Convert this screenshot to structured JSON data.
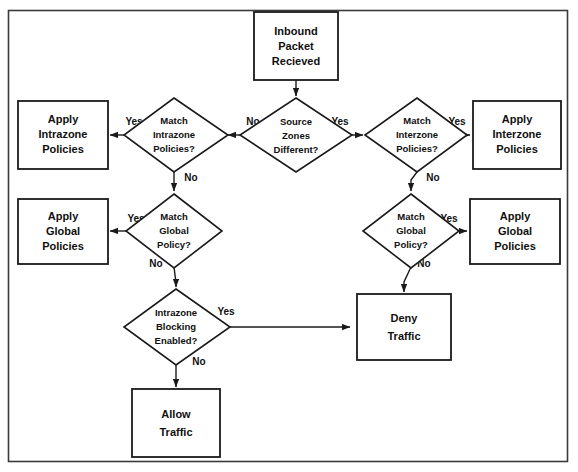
{
  "diagram": {
    "type": "flowchart",
    "colors": {
      "background": "#ffffff",
      "stroke": "#1a1a1a",
      "text": "#101010",
      "frame": "#3a3a3a"
    },
    "frame": {
      "x": 8,
      "y": 10,
      "width": 560,
      "height": 452
    },
    "nodes": [
      {
        "id": "inbound-packet",
        "shape": "process",
        "lines": [
          "Inbound",
          "Packet",
          "Recieved"
        ],
        "cx": 296,
        "cy": 46,
        "w": 84,
        "h": 68
      },
      {
        "id": "source-zones-different",
        "shape": "decision",
        "lines": [
          "Source",
          "Zones",
          "Different?"
        ],
        "cx": 296,
        "cy": 135,
        "w": 112,
        "h": 74
      },
      {
        "id": "match-intrazone-policies",
        "shape": "decision",
        "lines": [
          "Match",
          "Intrazone",
          "Policies?"
        ],
        "cx": 174,
        "cy": 135,
        "w": 100,
        "h": 74
      },
      {
        "id": "match-interzone-policies",
        "shape": "decision",
        "lines": [
          "Match",
          "Interzone",
          "Policies?"
        ],
        "cx": 417,
        "cy": 135,
        "w": 100,
        "h": 74
      },
      {
        "id": "apply-intrazone-policies",
        "shape": "process",
        "lines": [
          "Apply",
          "Intrazone",
          "Policies"
        ],
        "cx": 62,
        "cy": 135,
        "w": 88,
        "h": 68
      },
      {
        "id": "apply-interzone-policies",
        "shape": "process",
        "lines": [
          "Apply",
          "Interzone",
          "Policies"
        ],
        "cx": 518,
        "cy": 135,
        "w": 88,
        "h": 68
      },
      {
        "id": "match-global-policy-left",
        "shape": "decision",
        "lines": [
          "Match",
          "Global",
          "Policy?"
        ],
        "cx": 174,
        "cy": 231,
        "w": 96,
        "h": 72
      },
      {
        "id": "match-global-policy-right",
        "shape": "decision",
        "lines": [
          "Match",
          "Global",
          "Policy?"
        ],
        "cx": 411,
        "cy": 231,
        "w": 96,
        "h": 72
      },
      {
        "id": "apply-global-policies-left",
        "shape": "process",
        "lines": [
          "Apply",
          "Global",
          "Policies"
        ],
        "cx": 62,
        "cy": 231,
        "w": 88,
        "h": 66
      },
      {
        "id": "apply-global-policies-right",
        "shape": "process",
        "lines": [
          "Apply",
          "Global",
          "Policies"
        ],
        "cx": 516,
        "cy": 231,
        "w": 90,
        "h": 66
      },
      {
        "id": "intrazone-blocking-enabled",
        "shape": "decision",
        "lines": [
          "Intrazone",
          "Blocking",
          "Enabled?"
        ],
        "cx": 176,
        "cy": 327,
        "w": 108,
        "h": 76
      },
      {
        "id": "deny-traffic",
        "shape": "process",
        "lines": [
          "Deny",
          "Traffic"
        ],
        "cx": 404,
        "cy": 327,
        "w": 94,
        "h": 66
      },
      {
        "id": "allow-traffic",
        "shape": "process",
        "lines": [
          "Allow",
          "Traffic"
        ],
        "cx": 176,
        "cy": 423,
        "w": 88,
        "h": 68
      }
    ],
    "edges": [
      {
        "id": "e-packet-to-zones",
        "from": "inbound-packet",
        "to": "source-zones-different",
        "label": ""
      },
      {
        "id": "e-zones-no-intrazone",
        "from": "source-zones-different",
        "to": "match-intrazone-policies",
        "label": "No"
      },
      {
        "id": "e-zones-yes-interzone",
        "from": "source-zones-different",
        "to": "match-interzone-policies",
        "label": "Yes"
      },
      {
        "id": "e-intrazone-yes-apply",
        "from": "match-intrazone-policies",
        "to": "apply-intrazone-policies",
        "label": "Yes"
      },
      {
        "id": "e-interzone-yes-apply",
        "from": "match-interzone-policies",
        "to": "apply-interzone-policies",
        "label": "Yes"
      },
      {
        "id": "e-intrazone-no-global",
        "from": "match-intrazone-policies",
        "to": "match-global-policy-left",
        "label": "No"
      },
      {
        "id": "e-interzone-no-global",
        "from": "match-interzone-policies",
        "to": "match-global-policy-right",
        "label": "No"
      },
      {
        "id": "e-global-left-yes-apply",
        "from": "match-global-policy-left",
        "to": "apply-global-policies-left",
        "label": "Yes"
      },
      {
        "id": "e-global-right-yes-apply",
        "from": "match-global-policy-right",
        "to": "apply-global-policies-right",
        "label": "Yes"
      },
      {
        "id": "e-global-left-no-blocking",
        "from": "match-global-policy-left",
        "to": "intrazone-blocking-enabled",
        "label": "No"
      },
      {
        "id": "e-global-right-no-deny",
        "from": "match-global-policy-right",
        "to": "deny-traffic",
        "label": "No"
      },
      {
        "id": "e-blocking-yes-deny",
        "from": "intrazone-blocking-enabled",
        "to": "deny-traffic",
        "label": "Yes"
      },
      {
        "id": "e-blocking-no-allow",
        "from": "intrazone-blocking-enabled",
        "to": "allow-traffic",
        "label": "No"
      }
    ],
    "edge_labels": {
      "zones_no": "No",
      "zones_yes": "Yes",
      "intrazone_yes": "Yes",
      "intrazone_no": "No",
      "interzone_yes": "Yes",
      "interzone_no": "No",
      "global_left_yes": "Yes",
      "global_left_no": "No",
      "global_right_yes": "Yes",
      "global_right_no": "No",
      "blocking_yes": "Yes",
      "blocking_no": "No"
    }
  }
}
